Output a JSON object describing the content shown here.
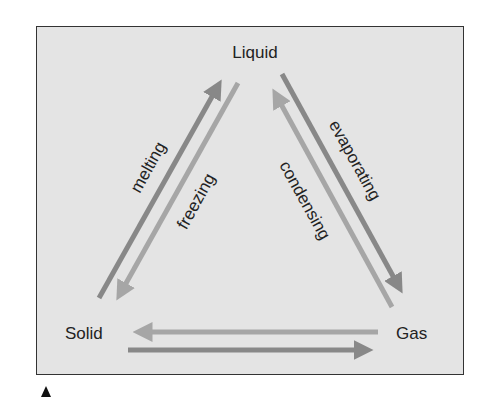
{
  "diagram": {
    "nodes": {
      "liquid": "Liquid",
      "solid": "Solid",
      "gas": "Gas"
    },
    "transitions": {
      "melting": "melting",
      "freezing": "freezing",
      "evaporating": "evaporating",
      "condensing": "condensing"
    },
    "colors": {
      "panel_bg": "#e4e4e4",
      "dark_arrow": "#888888",
      "light_arrow": "#a6a6a6"
    }
  }
}
